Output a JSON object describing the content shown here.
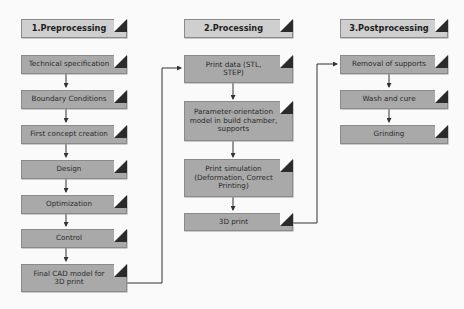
{
  "columns": [
    {
      "header": "1.Preprocessing",
      "steps": [
        "Technical specification",
        "Boundary Conditions",
        "First concept creation",
        "Design",
        "Optimization",
        "Control",
        "Final CAD model for 3D print"
      ]
    },
    {
      "header": "2.Processing",
      "steps": [
        "Print data (STL, STEP)",
        "Parameter-orientation model in build chamber, supports",
        "Print simulation (Deformation, Correct Printing)",
        "3D print"
      ]
    },
    {
      "header": "3.Postprocessing",
      "steps": [
        "Removal of supports",
        "Wash and cure",
        "Grinding"
      ]
    }
  ],
  "colors": {
    "box_fill": "#a9a9a9",
    "header_fill": "#cfcfcf",
    "fold": "#2b2b2b",
    "line": "#333333",
    "background": "#fafafa"
  }
}
